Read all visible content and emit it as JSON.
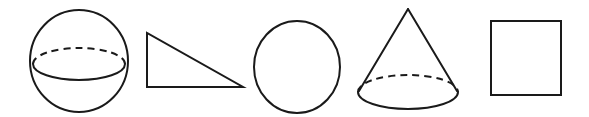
{
  "figure": {
    "background_color": "#ffffff",
    "stroke_color": "#1a1a1a",
    "width": 589,
    "height": 117,
    "shape_count": 5
  },
  "shapes": [
    {
      "index": 1,
      "name": "sphere",
      "label": "Sphere",
      "kind": "3d-solid",
      "bounds": {
        "x": 30,
        "y": 10,
        "width": 98,
        "height": 102
      },
      "center": {
        "cx": 79,
        "cy": 61
      },
      "radii": {
        "rx": 49,
        "ry": 51
      },
      "equator": {
        "cx": 79,
        "cy": 64,
        "rx": 46,
        "ry": 16,
        "back_arc_style": "dashed",
        "front_arc_style": "solid"
      }
    },
    {
      "index": 2,
      "name": "right-triangle",
      "label": "Right triangle",
      "kind": "2d-polygon",
      "bounds": {
        "x": 146,
        "y": 32,
        "width": 97,
        "height": 56
      },
      "vertices": [
        {
          "x": 147,
          "y": 33
        },
        {
          "x": 147,
          "y": 87
        },
        {
          "x": 243,
          "y": 87
        }
      ],
      "right_angle_at": "bottom-left",
      "points": "147,33 147,87 243,87"
    },
    {
      "index": 3,
      "name": "circle",
      "label": "Circle",
      "kind": "2d-closed-curve",
      "bounds": {
        "x": 254,
        "y": 21,
        "width": 87,
        "height": 92
      },
      "center": {
        "cx": 297,
        "cy": 67
      },
      "radii": {
        "rx": 43,
        "ry": 46
      }
    },
    {
      "index": 4,
      "name": "cone",
      "label": "Cone",
      "kind": "3d-solid",
      "bounds": {
        "x": 358,
        "y": 8,
        "width": 100,
        "height": 101
      },
      "apex": {
        "x": 408,
        "y": 9
      },
      "base": {
        "cx": 408,
        "cy": 92,
        "rx": 50,
        "ry": 17,
        "back_arc_style": "dashed",
        "front_arc_style": "solid"
      },
      "left_edge": {
        "x1": 408,
        "y1": 9,
        "x2": 360,
        "y2": 90
      },
      "right_edge": {
        "x1": 408,
        "y1": 9,
        "x2": 456,
        "y2": 90
      }
    },
    {
      "index": 5,
      "name": "square",
      "label": "Square",
      "kind": "2d-polygon",
      "bounds": {
        "x": 490,
        "y": 20,
        "width": 72,
        "height": 76
      },
      "corners": {
        "top_left": {
          "x": 491,
          "y": 21
        },
        "top_right": {
          "x": 561,
          "y": 21
        },
        "bottom_right": {
          "x": 561,
          "y": 95
        },
        "bottom_left": {
          "x": 491,
          "y": 95
        }
      }
    }
  ]
}
